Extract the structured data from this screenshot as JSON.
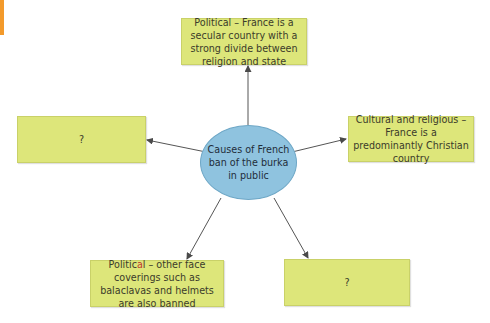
{
  "diagram": {
    "center": {
      "label": "Causes of French ban of the burka in public",
      "fill": "#8fc3df"
    },
    "box_fill": "#dde67a",
    "accent_color": "#f39a2b",
    "nodes": [
      {
        "id": "top",
        "label": "Political – France is a secular country with a strong divide between religion and state"
      },
      {
        "id": "right",
        "label": "Cultural and religious – France is a predominantly Christian country"
      },
      {
        "id": "left",
        "label": "?"
      },
      {
        "id": "bottom_left_prefix",
        "label": "Politic"
      },
      {
        "id": "bottom_left_red",
        "label": "a"
      },
      {
        "id": "bottom_left_rest",
        "label": "l – other face coverings such as balaclavas and helmets are also banned"
      },
      {
        "id": "bottom_right",
        "label": "?"
      }
    ]
  }
}
